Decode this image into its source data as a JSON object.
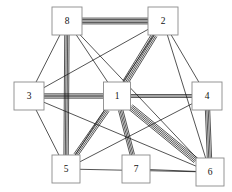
{
  "figure": {
    "width": 232,
    "height": 192,
    "background_color": "#ffffff",
    "edge_color": "#1b1b1b",
    "node_fill": "#ffffff",
    "node_stroke": "#8a8a8a",
    "label_color": "#111111"
  },
  "chart_data": {
    "type": "diagram",
    "subtype": "node-link-graph",
    "title": "",
    "directed": false,
    "node_shape": "square",
    "nodes": [
      {
        "id": "1",
        "label": "1",
        "x": 117,
        "y": 96,
        "w": 27,
        "h": 28
      },
      {
        "id": "2",
        "label": "2",
        "x": 163,
        "y": 21,
        "w": 30,
        "h": 28
      },
      {
        "id": "3",
        "label": "3",
        "x": 29,
        "y": 96,
        "w": 30,
        "h": 28
      },
      {
        "id": "4",
        "label": "4",
        "x": 207,
        "y": 96,
        "w": 30,
        "h": 28
      },
      {
        "id": "5",
        "label": "5",
        "x": 66,
        "y": 169,
        "w": 28,
        "h": 28
      },
      {
        "id": "6",
        "label": "6",
        "x": 210,
        "y": 172,
        "w": 28,
        "h": 28
      },
      {
        "id": "7",
        "label": "7",
        "x": 136,
        "y": 169,
        "w": 28,
        "h": 28
      },
      {
        "id": "8",
        "label": "8",
        "x": 67,
        "y": 21,
        "w": 30,
        "h": 28
      }
    ],
    "edges": [
      {
        "source": "8",
        "target": "2",
        "multiplicity": 5
      },
      {
        "source": "8",
        "target": "3",
        "multiplicity": 1
      },
      {
        "source": "8",
        "target": "6",
        "multiplicity": 1
      },
      {
        "source": "8",
        "target": "5",
        "multiplicity": 4
      },
      {
        "source": "8",
        "target": "1",
        "multiplicity": 1
      },
      {
        "source": "2",
        "target": "1",
        "multiplicity": 5
      },
      {
        "source": "2",
        "target": "4",
        "multiplicity": 1
      },
      {
        "source": "2",
        "target": "5",
        "multiplicity": 1
      },
      {
        "source": "2",
        "target": "6",
        "multiplicity": 1
      },
      {
        "source": "3",
        "target": "1",
        "multiplicity": 4
      },
      {
        "source": "3",
        "target": "2",
        "multiplicity": 1
      },
      {
        "source": "3",
        "target": "5",
        "multiplicity": 1
      },
      {
        "source": "3",
        "target": "6",
        "multiplicity": 1
      },
      {
        "source": "1",
        "target": "4",
        "multiplicity": 3
      },
      {
        "source": "1",
        "target": "5",
        "multiplicity": 4
      },
      {
        "source": "1",
        "target": "7",
        "multiplicity": 4
      },
      {
        "source": "1",
        "target": "6",
        "multiplicity": 5
      },
      {
        "source": "4",
        "target": "6",
        "multiplicity": 4
      },
      {
        "source": "4",
        "target": "5",
        "multiplicity": 1
      },
      {
        "source": "5",
        "target": "6",
        "multiplicity": 1
      },
      {
        "source": "7",
        "target": "6",
        "multiplicity": 1
      }
    ],
    "node_count": 8,
    "edge_count": 21,
    "legend": [],
    "xlabel": "",
    "ylabel": ""
  }
}
